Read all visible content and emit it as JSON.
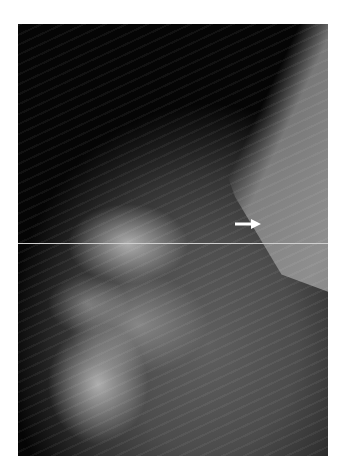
{
  "image": {
    "subject": "mammogram, mediolateral oblique view",
    "annotation": {
      "type": "arrow",
      "direction": "right",
      "color": "#ffffff"
    },
    "colors": {
      "background": "#ffffff",
      "air": "#050505",
      "tissue": "#5f5f5f",
      "pectoral_muscle": "#8e8e8e"
    }
  }
}
